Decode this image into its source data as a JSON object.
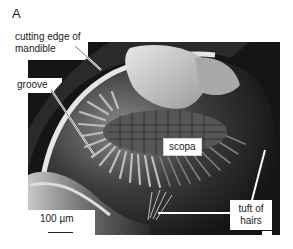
{
  "figure": {
    "panel_letter": "A",
    "labels": {
      "cutting_edge": "cutting edge of mandible",
      "groove": "groove",
      "scopa": "scopa",
      "tuft": "tuft of hairs"
    },
    "scale_bar": {
      "text": "100 µm"
    }
  }
}
